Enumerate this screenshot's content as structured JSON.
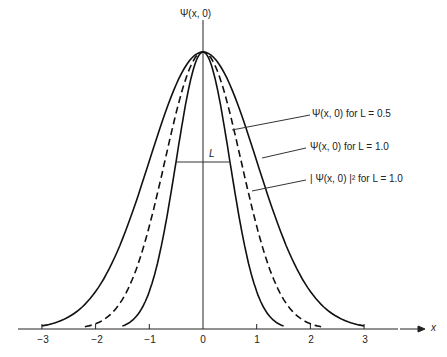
{
  "chart_data": {
    "type": "line",
    "title": "",
    "xlabel": "x",
    "ylabel": "Ψ(x, 0)",
    "xlim": [
      -3.5,
      3.5
    ],
    "x_ticks": [
      "-3",
      "-2",
      "-1",
      "0",
      "1",
      "2",
      "3"
    ],
    "grid": false,
    "series": [
      {
        "name": "Ψ(x, 0) for L = 0.5",
        "style": "solid",
        "sigma": 0.5,
        "peak": 1.0,
        "x_extent": [
          -1.5,
          1.5
        ]
      },
      {
        "name": "Ψ(x, 0) for L = 1.0",
        "style": "solid",
        "sigma": 1.0,
        "peak": 1.0,
        "x_extent": [
          -3,
          3
        ]
      },
      {
        "name": "| Ψ(x, 0) |² for L = 1.0",
        "style": "dashed",
        "sigma": 0.71,
        "peak": 1.0,
        "x_extent": [
          -2.2,
          2.2
        ]
      }
    ],
    "annotations": [
      {
        "text": "L",
        "type": "width-marker",
        "x_from": -0.5,
        "x_to": 0.5,
        "y": 0.6
      }
    ]
  },
  "labels": {
    "y_axis": "Ψ(x, 0)",
    "x_axis": "x",
    "width_marker": "L",
    "legend": [
      "Ψ(x, 0) for L = 0.5",
      "Ψ(x, 0) for L = 1.0",
      "| Ψ(x, 0) |² for L = 1.0"
    ],
    "ticks": [
      "−3",
      "−2",
      "−1",
      "0",
      "1",
      "2",
      "3"
    ]
  }
}
